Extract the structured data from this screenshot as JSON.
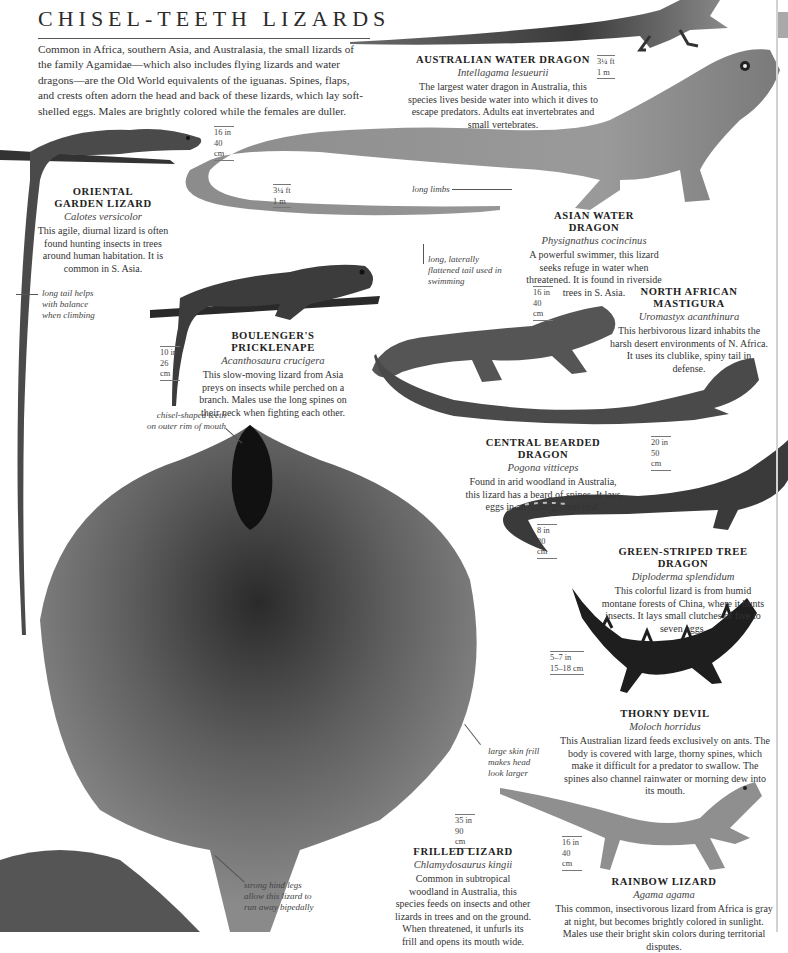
{
  "page": {
    "title": "CHISEL-TEETH LIZARDS",
    "intro": "Common in Africa, southern Asia, and Australasia, the small lizards of the family Agamidae—which also includes flying lizards and water dragons—are the Old World equivalents of the iguanas. Spines, flaps, and crests often adorn the head and back of these lizards, which lay soft-shelled eggs. Males are brightly colored while the females are duller.",
    "edge_tab_color": "#a9a9a9"
  },
  "entries": [
    {
      "id": "australian-water-dragon",
      "name": "AUSTRALIAN WATER DRAGON",
      "scientific": "Intellagama lesueurii",
      "description": "The largest water dragon in Australia, this species lives beside water into which it dives to escape predators. Adults eat invertebrates and small vertebrates.",
      "size": [
        "3¼ ft",
        "1 m"
      ]
    },
    {
      "id": "oriental-garden-lizard",
      "name": "ORIENTAL GARDEN LIZARD",
      "name_lines": [
        "ORIENTAL",
        "GARDEN LIZARD"
      ],
      "scientific": "Calotes versicolor",
      "description": "This agile, diurnal lizard is often found hunting insects in trees around human habitation. It is common in S. Asia.",
      "size": [
        "16 in",
        "40 cm"
      ]
    },
    {
      "id": "asian-water-dragon",
      "name": "ASIAN WATER DRAGON",
      "name_lines": [
        "ASIAN WATER",
        "DRAGON"
      ],
      "scientific": "Physignathus cocincinus",
      "description": "A powerful swimmer, this lizard seeks refuge in water when threatened. It is found in riverside trees in S. Asia.",
      "size": [
        "3¼ ft",
        "1 m"
      ]
    },
    {
      "id": "north-african-mastigura",
      "name": "NORTH AFRICAN MASTIGURA",
      "scientific": "Uromastyx acanthinura",
      "description": "This herbivorous lizard inhabits the harsh desert environments of N. Africa. It uses its clublike, spiny tail in defense.",
      "size": [
        "16 in",
        "40 cm"
      ]
    },
    {
      "id": "boulengers-pricklenape",
      "name": "BOULENGER'S PRICKLENAPE",
      "name_lines": [
        "BOULENGER'S",
        "PRICKLENAPE"
      ],
      "scientific": "Acanthosaura crucigera",
      "description": "This slow-moving lizard from Asia preys on insects while perched on a branch. Males use the long spines on their neck when fighting each other.",
      "size": [
        "10 in",
        "26 cm"
      ]
    },
    {
      "id": "central-bearded-dragon",
      "name": "CENTRAL BEARDED DRAGON",
      "scientific": "Pogona vitticeps",
      "description": "Found in arid woodland in Australia, this lizard has a beard of spines. It lays eggs in an underground nest.",
      "size": [
        "20 in",
        "50 cm"
      ]
    },
    {
      "id": "green-striped-tree-dragon",
      "name": "GREEN-STRIPED TREE DRAGON",
      "scientific": "Diploderma splendidum",
      "description": "This colorful lizard is from humid montane forests of China, where it hunts insects. It lays small clutches of five to seven eggs.",
      "size": [
        "8 in",
        "20 cm"
      ]
    },
    {
      "id": "thorny-devil",
      "name": "THORNY DEVIL",
      "scientific": "Moloch horridus",
      "description": "This Australian lizard feeds exclusively on ants. The body is covered with large, thorny spines, which make it difficult for a predator to swallow. The spines also channel rainwater or morning dew into its mouth.",
      "size": [
        "5–7 in",
        "15–18 cm"
      ]
    },
    {
      "id": "frilled-lizard",
      "name": "FRILLED LIZARD",
      "scientific": "Chlamydosaurus kingii",
      "description": "Common in subtropical woodland in Australia, this species feeds on insects and other lizards in trees and on the ground. When threatened, it unfurls its frill and opens its mouth wide.",
      "size": [
        "35 in",
        "90 cm"
      ]
    },
    {
      "id": "rainbow-lizard",
      "name": "RAINBOW LIZARD",
      "scientific": "Agama agama",
      "description": "This common, insectivorous lizard from Africa is gray at night, but becomes brightly colored in sunlight. Males use their bright skin colors during territorial disputes.",
      "size": [
        "16 in",
        "40 cm"
      ]
    }
  ],
  "annotations": [
    {
      "id": "long-tail",
      "text": "long tail helps with balance when climbing"
    },
    {
      "id": "long-limbs",
      "text": "long limbs"
    },
    {
      "id": "flattened-tail",
      "text": "long, laterally flattened tail used in swimming"
    },
    {
      "id": "chisel-teeth",
      "text": "chisel-shaped teeth on outer rim of mouth"
    },
    {
      "id": "skin-frill",
      "text": "large skin frill makes head look larger"
    },
    {
      "id": "hind-legs",
      "text": "strong hind legs allow this lizard to run away bipedally"
    }
  ]
}
